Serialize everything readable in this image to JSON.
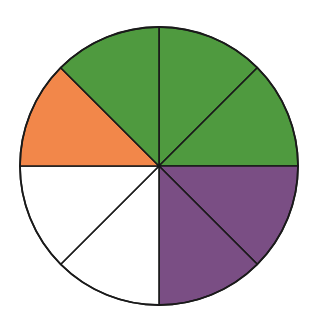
{
  "diagram": {
    "type": "fraction-circle",
    "total_slices": 8,
    "center": [
      159,
      166
    ],
    "radius": 139,
    "stroke": "#1a1a1a",
    "colors": {
      "green": "#4f9a3f",
      "orange": "#f2874a",
      "purple": "#7a4e84",
      "white": "#ffffff"
    },
    "slices": [
      {
        "index": 0,
        "position": "top-right-upper",
        "color": "green"
      },
      {
        "index": 1,
        "position": "top-right-lower",
        "color": "green"
      },
      {
        "index": 2,
        "position": "bottom-right-upper",
        "color": "purple"
      },
      {
        "index": 3,
        "position": "bottom-right-lower",
        "color": "purple"
      },
      {
        "index": 4,
        "position": "bottom-left-lower",
        "color": "white"
      },
      {
        "index": 5,
        "position": "bottom-left-upper",
        "color": "white"
      },
      {
        "index": 6,
        "position": "top-left-lower",
        "color": "orange"
      },
      {
        "index": 7,
        "position": "top-left-upper",
        "color": "green"
      }
    ]
  },
  "chart_data": {
    "type": "pie",
    "title": "",
    "categories": [
      "green",
      "purple",
      "white",
      "orange"
    ],
    "values": [
      3,
      2,
      2,
      1
    ],
    "total": 8
  }
}
